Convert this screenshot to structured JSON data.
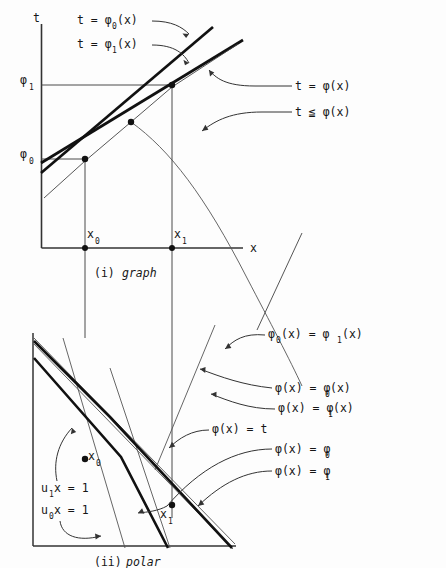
{
  "figure": {
    "panels": [
      {
        "id": "graph-panel",
        "caption_index": "(i)",
        "caption_word": "graph",
        "axis_t_label": "t",
        "axis_x_label": "x",
        "tick_labels": {
          "phi1": "φ",
          "phi1_sub": "1",
          "phi0": "φ",
          "phi0_sub": "0",
          "x0": "x",
          "x0_sub": "0",
          "x1": "x",
          "x1_sub": "1"
        },
        "annotations": [
          {
            "name": "t-equals-phi0-of-x",
            "text": "t = φ",
            "sub": "0",
            "tail": "(x)"
          },
          {
            "name": "t-equals-phi1-of-x",
            "text": "t = φ",
            "sub": "1",
            "tail": "(x)"
          },
          {
            "name": "t-equals-phi-of-x",
            "text": "t = φ(x)"
          },
          {
            "name": "t-leq-phi-of-x",
            "text": "t ≦ φ(x)"
          }
        ]
      },
      {
        "id": "polar-panel",
        "caption_index": "(ii)",
        "caption_word": "polar",
        "tick_labels": {
          "x0": "x",
          "x0_sub": "0",
          "x1": "x",
          "x1_sub": "1"
        },
        "left_annotations": [
          {
            "name": "u1-x-equals-1",
            "text": "u",
            "sub": "1",
            "tail": "x = 1"
          },
          {
            "name": "u0-x-equals-1",
            "text": "u",
            "sub": "0",
            "tail": "x = 1"
          }
        ],
        "right_annotations": [
          {
            "name": "phi0x-equals-phi1x",
            "lead": "φ",
            "lead_sub": "0",
            "mid": "(x) = φ",
            "mid_sub": "1",
            "tail": "(x)"
          },
          {
            "name": "phix-equals-phi0x",
            "lead": "φ(x) = φ",
            "lead_sub": "0",
            "mid": "(x)",
            "mid_sub": "",
            "tail": ""
          },
          {
            "name": "phix-equals-phi1x",
            "lead": "φ(x) = φ",
            "lead_sub": "1",
            "mid": "(x)",
            "mid_sub": "",
            "tail": ""
          },
          {
            "name": "phix-equals-t",
            "lead": "φ(x) = t",
            "lead_sub": "",
            "mid": "",
            "mid_sub": "",
            "tail": ""
          },
          {
            "name": "phix-equals-phi0",
            "lead": "φ(x) = φ",
            "lead_sub": "0",
            "mid": "",
            "mid_sub": "",
            "tail": ""
          },
          {
            "name": "phix-equals-phi1",
            "lead": "φ(x) = φ",
            "lead_sub": "1",
            "mid": "",
            "mid_sub": "",
            "tail": ""
          }
        ]
      }
    ],
    "colors": {
      "ink": "#161616",
      "thin": "#555555",
      "paper": "#fdfdfd"
    }
  }
}
